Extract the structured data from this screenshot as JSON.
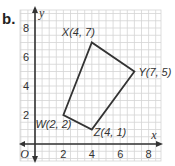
{
  "part_label": "b.",
  "axes": {
    "x_label": "x",
    "y_label": "y",
    "origin_label": "O",
    "x_ticks": [
      "2",
      "4",
      "6",
      "8"
    ],
    "y_ticks": [
      "2",
      "4",
      "6",
      "8"
    ],
    "x_range": [
      -1,
      8.8
    ],
    "y_range": [
      -1,
      9.3
    ]
  },
  "polygon": {
    "vertices": [
      {
        "name": "W",
        "x": 2,
        "y": 2,
        "label": "W(2, 2)"
      },
      {
        "name": "X",
        "x": 4,
        "y": 7,
        "label": "X(4, 7)"
      },
      {
        "name": "Y",
        "x": 7,
        "y": 5,
        "label": "Y(7, 5)"
      },
      {
        "name": "Z",
        "x": 4,
        "y": 1,
        "label": "Z(4, 1)"
      }
    ]
  },
  "colors": {
    "grid": "#d4d4d4",
    "axis": "#333333",
    "polygon": "#333333",
    "text": "#333333"
  }
}
